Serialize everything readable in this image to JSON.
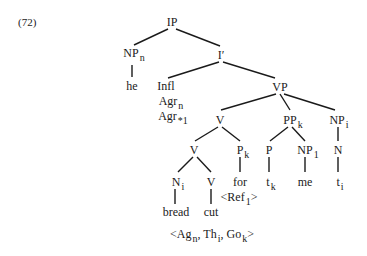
{
  "example_number": "(72)",
  "tree": {
    "IP": {
      "label": "IP"
    },
    "NPn": {
      "label": "NP",
      "sub": "n"
    },
    "Ibar": {
      "label": "I′"
    },
    "he": {
      "label": "he"
    },
    "Infl": {
      "label": "Infl"
    },
    "Agr1": {
      "label": "Agr",
      "sub": "n"
    },
    "Agr2": {
      "label": "Agr",
      "sub": "*1"
    },
    "VP": {
      "label": "VP"
    },
    "V1": {
      "label": "V"
    },
    "PPk": {
      "label": "PP",
      "sub": "k"
    },
    "NPi": {
      "label": "NP",
      "sub": "i"
    },
    "V2": {
      "label": "V"
    },
    "Pk": {
      "label": "P",
      "sub": "k"
    },
    "P": {
      "label": "P"
    },
    "NP1": {
      "label": "NP",
      "sub": "1"
    },
    "N": {
      "label": "N"
    },
    "Ni": {
      "label": "N",
      "sub": "i"
    },
    "V3": {
      "label": "V"
    },
    "for": {
      "label": "for"
    },
    "tk": {
      "label": "t",
      "sub": "k"
    },
    "me": {
      "label": "me"
    },
    "ti": {
      "label": "t",
      "sub": "i"
    },
    "ref": {
      "pre": "<Ref",
      "sub": "1",
      "post": ">"
    },
    "bread": {
      "label": "bread"
    },
    "cut": {
      "label": "cut"
    },
    "theta": {
      "open": "<",
      "ag": "Ag",
      "ag_sub": "n",
      "sep1": ", ",
      "th": "Th",
      "th_sub": "i",
      "sep2": ", ",
      "go": "Go",
      "go_sub": "k",
      "close": ">"
    }
  }
}
